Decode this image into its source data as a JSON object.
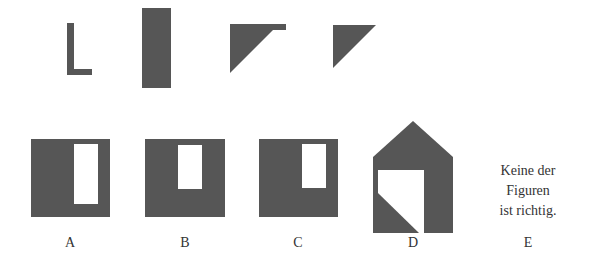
{
  "puzzle": {
    "fill_color": "#565656",
    "background_color": "#ffffff",
    "pieces": [
      {
        "id": "piece-l-shape",
        "shape": "L-shape"
      },
      {
        "id": "piece-tall-rectangle",
        "shape": "tall rectangle"
      },
      {
        "id": "piece-triangle-with-tab",
        "shape": "right triangle with top tab"
      },
      {
        "id": "piece-right-triangle",
        "shape": "right triangle"
      }
    ],
    "options": [
      {
        "letter": "A",
        "shape": "square with tall window"
      },
      {
        "letter": "B",
        "shape": "square with short window"
      },
      {
        "letter": "C",
        "shape": "square with short right window"
      },
      {
        "letter": "D",
        "shape": "house with cut window"
      },
      {
        "letter": "E",
        "text_lines": [
          "Keine der",
          "Figuren",
          "ist richtig."
        ]
      }
    ]
  }
}
